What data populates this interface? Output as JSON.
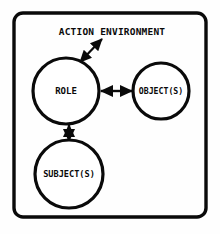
{
  "figure": {
    "title": "ACTION ENVIRONMENT",
    "style": {
      "background_color": "#fefefe",
      "ink_color": "#0a0a0a",
      "node_fill": "#ffffff",
      "frame_stroke_width": 3.4,
      "node_stroke_width": 3.2,
      "connector_stroke_width": 2.2
    },
    "frame": {
      "x": 14,
      "y": 13,
      "width": 192,
      "height": 204,
      "corner_radius": 9
    },
    "title_position": {
      "x": 112,
      "y": 31,
      "font_size": 9.5
    },
    "nodes": [
      {
        "id": "role",
        "label": "ROLE",
        "cx": 66,
        "cy": 91,
        "r": 33,
        "font_size": 9
      },
      {
        "id": "objects",
        "label": "OBJECT(S)",
        "cx": 161,
        "cy": 91,
        "r": 28,
        "font_size": 8.2
      },
      {
        "id": "subjects",
        "label": "SUBJECT(S)",
        "cx": 69,
        "cy": 174,
        "r": 34,
        "font_size": 8.6
      }
    ],
    "connectors": [
      {
        "id": "role-to-environment",
        "from": "role",
        "to": "action-environment-title",
        "kind": "double-headed-arrow",
        "orientation": "diagonal",
        "x1": 80,
        "y1": 62,
        "x2": 102,
        "y2": 39
      },
      {
        "id": "role-to-objects",
        "from": "role",
        "to": "objects",
        "kind": "double-headed-arrow",
        "orientation": "horizontal",
        "x1": 100,
        "y1": 91,
        "x2": 133,
        "y2": 91
      },
      {
        "id": "role-to-subjects",
        "from": "role",
        "to": "subjects",
        "kind": "double-headed-arrow",
        "orientation": "vertical",
        "x1": 69,
        "y1": 124,
        "x2": 69,
        "y2": 142
      }
    ]
  }
}
